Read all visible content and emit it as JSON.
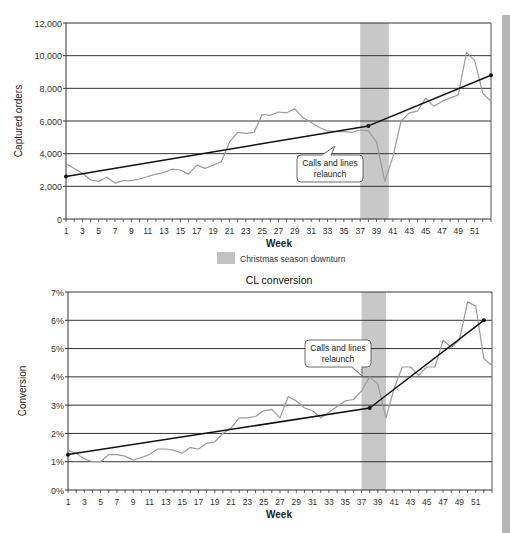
{
  "chart_data": [
    {
      "type": "line",
      "title": "",
      "xlabel": "Week",
      "ylabel": "Captured orders",
      "ylim": [
        0,
        12000
      ],
      "yticks": [
        0,
        2000,
        4000,
        6000,
        8000,
        10000,
        12000
      ],
      "ytick_labels": [
        "0",
        "2,000",
        "4,000",
        "6,000",
        "8,000",
        "10,000",
        "12,000"
      ],
      "xlim": [
        1,
        53
      ],
      "xtick_labels": [
        "1",
        "3",
        "5",
        "7",
        "9",
        "11",
        "13",
        "15",
        "17",
        "19",
        "21",
        "23",
        "25",
        "27",
        "29",
        "31",
        "33",
        "35",
        "37",
        "39",
        "41",
        "43",
        "45",
        "47",
        "49",
        "51"
      ],
      "grid": true,
      "shaded_region": {
        "x_start": 37,
        "x_end": 40.5,
        "label": "Christmas season downturn"
      },
      "annotation": {
        "text_line1": "Calls and lines",
        "text_line2": "relaunch",
        "points_to_week": 37.5
      },
      "series": [
        {
          "name": "Captured orders",
          "color": "#9a9a9a",
          "x": [
            1,
            2,
            3,
            4,
            5,
            6,
            7,
            8,
            9,
            10,
            11,
            12,
            13,
            14,
            15,
            16,
            17,
            18,
            19,
            20,
            21,
            22,
            23,
            24,
            25,
            26,
            27,
            28,
            29,
            30,
            31,
            32,
            33,
            34,
            35,
            36,
            37,
            38,
            39,
            40,
            41,
            42,
            43,
            44,
            45,
            46,
            47,
            48,
            49,
            50,
            51,
            52,
            53
          ],
          "values": [
            3400,
            3100,
            2800,
            2400,
            2300,
            2550,
            2200,
            2350,
            2350,
            2450,
            2600,
            2750,
            2850,
            3050,
            3000,
            2750,
            3300,
            3100,
            3300,
            3500,
            4700,
            5300,
            5250,
            5300,
            6400,
            6350,
            6550,
            6500,
            6750,
            6200,
            5900,
            5600,
            5400,
            5350,
            5350,
            5300,
            5450,
            5400,
            4700,
            2300,
            3800,
            6000,
            6500,
            6600,
            7400,
            6900,
            7200,
            7400,
            7600,
            10200,
            9700,
            7700,
            7200
          ]
        },
        {
          "name": "Trend",
          "color": "#111111",
          "x": [
            1,
            38,
            53
          ],
          "values": [
            2600,
            5700,
            8800
          ]
        }
      ]
    },
    {
      "type": "line",
      "title": "CL conversion",
      "xlabel": "Week",
      "ylabel": "Conversion",
      "ylim": [
        0,
        7
      ],
      "yticks": [
        0,
        1,
        2,
        3,
        4,
        5,
        6,
        7
      ],
      "ytick_labels": [
        "0%",
        "1%",
        "2%",
        "3%",
        "4%",
        "5%",
        "6%",
        "7%"
      ],
      "xlim": [
        1,
        53
      ],
      "xtick_labels": [
        "1",
        "3",
        "5",
        "7",
        "9",
        "11",
        "13",
        "15",
        "17",
        "19",
        "21",
        "23",
        "25",
        "27",
        "29",
        "31",
        "33",
        "35",
        "37",
        "39",
        "41",
        "43",
        "45",
        "47",
        "49",
        "51"
      ],
      "grid": true,
      "shaded_region": {
        "x_start": 37,
        "x_end": 40,
        "label": "Christmas season downturn"
      },
      "annotation": {
        "text_line1": "Calls and lines",
        "text_line2": "relaunch",
        "points_to_week": 37.8
      },
      "series": [
        {
          "name": "CL conversion",
          "color": "#9a9a9a",
          "x": [
            1,
            2,
            3,
            4,
            5,
            6,
            7,
            8,
            9,
            10,
            11,
            12,
            13,
            14,
            15,
            16,
            17,
            18,
            19,
            20,
            21,
            22,
            23,
            24,
            25,
            26,
            27,
            28,
            29,
            30,
            31,
            32,
            33,
            34,
            35,
            36,
            37,
            38,
            39,
            40,
            41,
            42,
            43,
            44,
            45,
            46,
            47,
            48,
            49,
            50,
            51,
            52,
            53
          ],
          "values": [
            1.4,
            1.3,
            1.1,
            1.0,
            1.0,
            1.25,
            1.25,
            1.2,
            1.05,
            1.15,
            1.25,
            1.45,
            1.45,
            1.4,
            1.3,
            1.5,
            1.45,
            1.65,
            1.7,
            2.0,
            2.2,
            2.55,
            2.55,
            2.6,
            2.8,
            2.85,
            2.55,
            3.3,
            3.15,
            2.9,
            2.8,
            2.55,
            2.75,
            2.95,
            3.15,
            3.2,
            3.5,
            4.0,
            3.75,
            2.55,
            3.6,
            4.35,
            4.35,
            4.05,
            4.35,
            4.35,
            5.3,
            5.05,
            5.3,
            6.65,
            6.5,
            4.65,
            4.4
          ]
        },
        {
          "name": "Trend",
          "color": "#111111",
          "x": [
            1,
            38,
            52
          ],
          "values": [
            1.25,
            2.9,
            6.0
          ]
        }
      ]
    }
  ],
  "legend": {
    "label": "Christmas season downturn",
    "swatch_color": "#c2c2c2"
  },
  "colors": {
    "shade": "#c8c8c8",
    "grid": "#333333",
    "series": "#9a9a9a",
    "trend": "#111111",
    "side_bar": "#b5b5b5"
  }
}
